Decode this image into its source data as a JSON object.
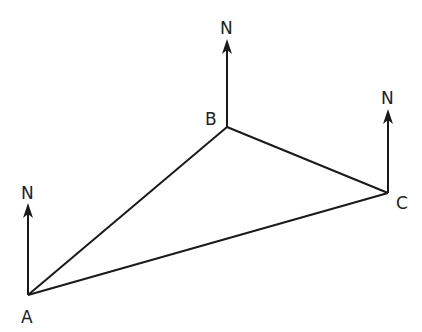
{
  "diagram": {
    "type": "bearing-triangle",
    "points": {
      "A": {
        "label": "A",
        "x": 28,
        "y": 295
      },
      "B": {
        "label": "B",
        "x": 227,
        "y": 127
      },
      "C": {
        "label": "C",
        "x": 388,
        "y": 193
      }
    },
    "north_label": "N",
    "north_arrows": [
      {
        "at": "A",
        "label": "N"
      },
      {
        "at": "B",
        "label": "N"
      },
      {
        "at": "C",
        "label": "N"
      }
    ],
    "edges": [
      [
        "A",
        "B"
      ],
      [
        "B",
        "C"
      ],
      [
        "A",
        "C"
      ]
    ],
    "line_color": "#1a1a1a"
  }
}
